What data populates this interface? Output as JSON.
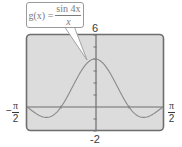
{
  "chart_data": {
    "type": "line",
    "title": "",
    "function_label": "g(x) = sin 4x / x",
    "function": "sin(4x)/x",
    "xlabel": "",
    "ylabel": "",
    "xlim": [
      -1.5708,
      1.5708
    ],
    "ylim": [
      -2,
      6
    ],
    "x_tick_labels": [
      "-π/2",
      "π/2"
    ],
    "y_tick_labels": [
      "6",
      "-2"
    ],
    "y_ticks_every": 1,
    "grid": false,
    "legend": null,
    "series": [
      {
        "name": "g(x) = sin 4x / x",
        "x": [
          -1.5708,
          -1.2,
          -1.1781,
          -0.9,
          -0.7854,
          -0.6,
          -0.4,
          -0.2,
          0,
          0.2,
          0.4,
          0.6,
          0.7854,
          0.9,
          1.1781,
          1.2,
          1.5708
        ],
        "y": [
          0,
          -0.83,
          -0.85,
          -0.49,
          0,
          1.13,
          2.5,
          3.59,
          4,
          3.59,
          2.5,
          1.13,
          0,
          -0.49,
          -0.85,
          -0.83,
          0
        ]
      }
    ],
    "annotations": [
      {
        "text": "g(x) = sin 4x / x",
        "points_to": [
          0,
          4
        ]
      }
    ]
  },
  "callout": {
    "lhs": "g(x) =",
    "numerator": "sin 4x",
    "denominator": "x"
  },
  "axes": {
    "ymax_label": "6",
    "ymin_label": "-2",
    "xmin_sign": "−",
    "xmin_num": "π",
    "xmin_den": "2",
    "xmax_num": "π",
    "xmax_den": "2"
  },
  "colors": {
    "screen_bg": "#dcdcdc",
    "screen_border": "#6e6e6e",
    "curve": "#8a8a8a",
    "axis": "#6e6e6e"
  }
}
